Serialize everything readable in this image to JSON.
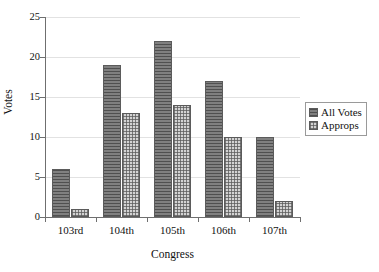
{
  "chart_data": {
    "type": "bar",
    "title": "",
    "subtitle": "",
    "xlabel": "Congress",
    "ylabel": "Votes",
    "categories": [
      "103rd",
      "104th",
      "105th",
      "106th",
      "107th"
    ],
    "series": [
      {
        "name": "All Votes",
        "values": [
          6,
          19,
          22,
          17,
          10
        ],
        "color": "#808080",
        "pattern": "horizontal-hatch"
      },
      {
        "name": "Approps",
        "values": [
          1,
          13,
          14,
          10,
          2
        ],
        "color": "#d3d3d3",
        "pattern": "checkered"
      }
    ],
    "ylim": [
      0,
      25
    ],
    "ytick_values": [
      0,
      5,
      10,
      15,
      20,
      25
    ],
    "ytick_labels": [
      "0",
      "5",
      "10",
      "15",
      "20",
      "25"
    ],
    "grid": "horizontal",
    "legend_position": "right",
    "legend_entries": [
      "All Votes",
      "Approps"
    ]
  }
}
